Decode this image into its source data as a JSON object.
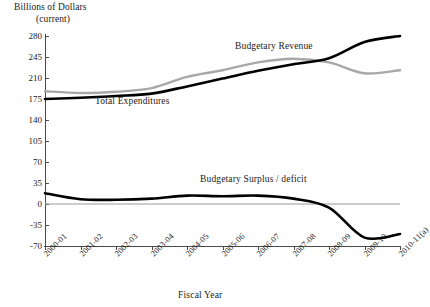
{
  "axes": {
    "y_title_line1": "Billions of Dollars",
    "y_title_line2": "(current)",
    "x_title": "Fiscal Year"
  },
  "series_labels": {
    "revenue": "Budgetary Revenue",
    "expenditures": "Total Expenditures",
    "balance": "Budgetary Surplus / deficit"
  },
  "colors": {
    "expenditures": "#000000",
    "revenue": "#a8a8a8",
    "balance": "#000000",
    "axis": "#4a4a4a",
    "zero_line": "#9a9a9a"
  },
  "chart_data": {
    "type": "line",
    "title": "",
    "xlabel": "Fiscal Year",
    "ylabel": "Billions of Dollars (current)",
    "ylim": [
      -70,
      280
    ],
    "yticks": [
      280,
      245,
      210,
      175,
      140,
      105,
      70,
      35,
      0,
      -35,
      -70
    ],
    "ytick_labels": [
      "280",
      "245",
      "210",
      "175",
      "140",
      "105",
      "70",
      "35",
      "0",
      "-35",
      "-70"
    ],
    "grid": false,
    "legend": "inline-annotations",
    "categories": [
      "2000-01",
      "2001-02",
      "2002-03",
      "2003-04",
      "2004-05",
      "2005-06",
      "2006-07",
      "2007-08",
      "2008-09",
      "2009-10",
      "2010-11(a)"
    ],
    "series": [
      {
        "name": "Total Expenditures",
        "color": "#000000",
        "values": [
          175,
          177,
          180,
          184,
          196,
          209,
          222,
          233,
          243,
          270,
          280
        ]
      },
      {
        "name": "Budgetary Revenue",
        "color": "#a8a8a8",
        "values": [
          188,
          185,
          187,
          193,
          212,
          223,
          236,
          242,
          236,
          218,
          223
        ]
      },
      {
        "name": "Budgetary Surplus / deficit",
        "color": "#000000",
        "values": [
          18,
          8,
          7,
          9,
          14,
          13,
          14,
          9,
          -6,
          -56,
          -50
        ]
      }
    ]
  }
}
